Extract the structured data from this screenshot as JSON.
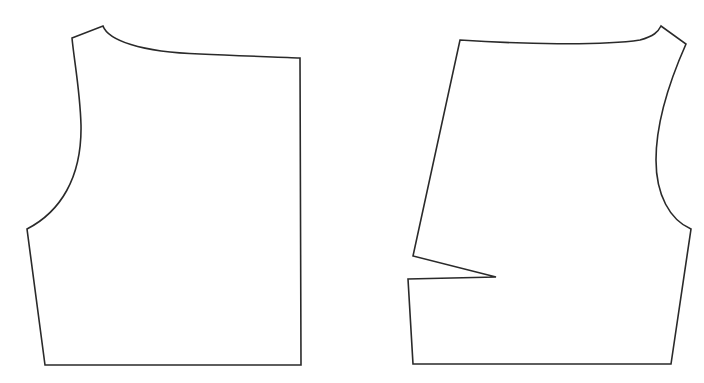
{
  "diagram": {
    "type": "sewing-pattern-pieces",
    "background": "#ffffff",
    "stroke_color": "#2a2a2a",
    "pieces": [
      {
        "id": "back-bodice",
        "name": "Left pattern piece (bodice back)",
        "vertices": {
          "shoulder_outer": [
            72,
            38
          ],
          "neck_point": [
            103,
            26
          ],
          "center_top": [
            300,
            58
          ],
          "center_bottom": [
            301,
            365
          ],
          "hem_side": [
            45,
            365
          ],
          "underarm": [
            27,
            229
          ],
          "armhole_deepest": [
            80,
            125
          ]
        },
        "path": "M72,38 L103,26 C108,40 140,52 200,54 C240,56 280,57 300,58 L301,365 L45,365 L27,229 C60,212 82,178 81,125 C80,90 74,60 72,38 Z"
      },
      {
        "id": "front-bodice",
        "name": "Right pattern piece (bodice front with dart)",
        "vertices": {
          "center_top": [
            460,
            40
          ],
          "neck_point": [
            661,
            26
          ],
          "shoulder_outer": [
            686,
            44
          ],
          "underarm": [
            691,
            229
          ],
          "hem_side": [
            671,
            364
          ],
          "hem_center": [
            413,
            364
          ],
          "dart_lower_leg": [
            408,
            279
          ],
          "dart_tip": [
            496,
            277
          ],
          "dart_upper_leg": [
            413,
            256
          ],
          "armhole_deepest": [
            656,
            160
          ]
        },
        "path": "M460,40 C520,44 600,46 640,40 C654,36 658,32 661,26 L686,44 C670,80 656,120 656,160 C656,195 670,220 691,229 L671,364 L413,364 L408,279 L496,277 L413,256 Z"
      }
    ]
  }
}
